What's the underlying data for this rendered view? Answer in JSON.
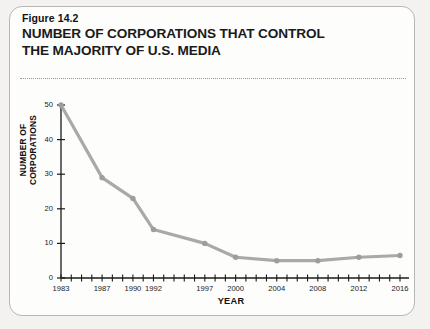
{
  "figure": {
    "number_label": "Figure 14.2",
    "title_line1": "NUMBER OF CORPORATIONS THAT CONTROL",
    "title_line2": "THE MAJORITY OF U.S. MEDIA"
  },
  "colors": {
    "line": "#a9a9a9",
    "marker": "#9d9d9d",
    "axis": "#1a1a1a",
    "card_background": "#fdfdfc",
    "page_background": "#f3f2f0",
    "card_border": "#b9b7b4",
    "rule": "#9a9894",
    "text": "#1a1a1a"
  },
  "chart_data": {
    "type": "line",
    "title": "NUMBER OF CORPORATIONS THAT CONTROL THE MAJORITY OF U.S. MEDIA",
    "xlabel": "YEAR",
    "ylabel": "NUMBER OF CORPORATIONS",
    "x": [
      1983,
      1987,
      1990,
      1992,
      1997,
      2000,
      2004,
      2008,
      2012,
      2016
    ],
    "values": [
      50,
      29,
      23,
      14,
      10,
      6,
      5,
      5,
      6,
      6.5
    ],
    "xlim": [
      1983,
      2016
    ],
    "ylim": [
      0,
      50
    ],
    "yticks": [
      0,
      10,
      20,
      30,
      40,
      50
    ],
    "ytick_labels": [
      "0",
      "10",
      "20",
      "30",
      "40",
      "50"
    ],
    "xticks": [
      1983,
      1984,
      1985,
      1986,
      1987,
      1988,
      1989,
      1990,
      1991,
      1992,
      1993,
      1994,
      1995,
      1996,
      1997,
      1998,
      1999,
      2000,
      2001,
      2002,
      2003,
      2004,
      2005,
      2006,
      2007,
      2008,
      2009,
      2010,
      2011,
      2012,
      2013,
      2014,
      2015,
      2016
    ],
    "xtick_labels_shown": [
      "1983",
      "1987",
      "1990",
      "1992",
      "1997",
      "2000",
      "2004",
      "2008",
      "2012",
      "2016"
    ],
    "grid": false,
    "legend": "none",
    "marker": "circle"
  }
}
